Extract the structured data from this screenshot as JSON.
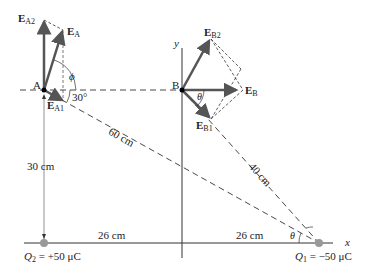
{
  "points": {
    "A": {
      "label": "A"
    },
    "B": {
      "label": "B"
    }
  },
  "vectors": {
    "EA": {
      "main": "E",
      "sub": "A"
    },
    "EA1": {
      "main": "E",
      "sub": "A1"
    },
    "EA2": {
      "main": "E",
      "sub": "A2"
    },
    "EB": {
      "main": "E",
      "sub": "B"
    },
    "EB1": {
      "main": "E",
      "sub": "B1"
    },
    "EB2": {
      "main": "E",
      "sub": "B2"
    }
  },
  "angles": {
    "phi": "ϕ",
    "thirty": "30°",
    "theta_B": "θ",
    "theta_Q1": "θ"
  },
  "distances": {
    "AQ1": "60 cm",
    "BQ1": "40 cm",
    "AQ2": "30 cm",
    "Q2_origin": "26 cm",
    "origin_Q1": "26 cm"
  },
  "axes": {
    "x": "x",
    "y": "y"
  },
  "charges": {
    "Q2": {
      "name": "Q",
      "sub": "2",
      "value": "= +50 μC"
    },
    "Q1": {
      "name": "Q",
      "sub": "1",
      "value": "= −50 μC"
    }
  },
  "colors": {
    "arrow": "#555555",
    "line": "#333333",
    "charge": "#999999"
  }
}
